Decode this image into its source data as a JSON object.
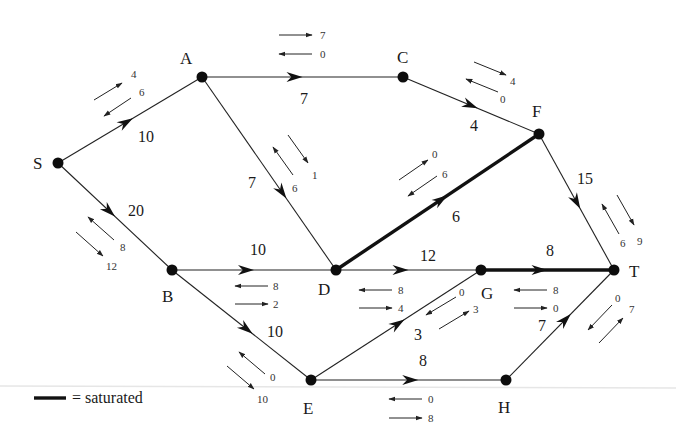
{
  "nodes": [
    {
      "id": "S",
      "x": 58,
      "y": 163,
      "lx": 33,
      "ly": 169
    },
    {
      "id": "A",
      "x": 202,
      "y": 77,
      "lx": 180,
      "ly": 64
    },
    {
      "id": "C",
      "x": 403,
      "y": 77,
      "lx": 397,
      "ly": 63
    },
    {
      "id": "F",
      "x": 539,
      "y": 134,
      "lx": 532,
      "ly": 117
    },
    {
      "id": "B",
      "x": 172,
      "y": 270,
      "lx": 162,
      "ly": 302
    },
    {
      "id": "D",
      "x": 336,
      "y": 270,
      "lx": 318,
      "ly": 295
    },
    {
      "id": "G",
      "x": 481,
      "y": 270,
      "lx": 481,
      "ly": 299
    },
    {
      "id": "T",
      "x": 614,
      "y": 270,
      "lx": 629,
      "ly": 277
    },
    {
      "id": "E",
      "x": 311,
      "y": 380,
      "lx": 303,
      "ly": 414
    },
    {
      "id": "H",
      "x": 506,
      "y": 380,
      "lx": 498,
      "ly": 413
    }
  ],
  "edges": [
    {
      "from": "S",
      "to": "A",
      "capacity": "10",
      "saturated": false,
      "t": 0.52,
      "cx": 138,
      "cy": 142
    },
    {
      "from": "S",
      "to": "B",
      "capacity": "20",
      "saturated": false,
      "t": 0.5,
      "cx": 128,
      "cy": 216
    },
    {
      "from": "A",
      "to": "C",
      "capacity": "7",
      "saturated": false,
      "t": 0.5,
      "cx": 300,
      "cy": 104
    },
    {
      "from": "A",
      "to": "D",
      "capacity": "7",
      "saturated": false,
      "t": 0.63,
      "cx": 248,
      "cy": 188
    },
    {
      "from": "C",
      "to": "F",
      "capacity": "4",
      "saturated": false,
      "t": 0.55,
      "cx": 470,
      "cy": 131
    },
    {
      "from": "D",
      "to": "F",
      "capacity": "6",
      "saturated": true,
      "t": 0.55,
      "cx": 452,
      "cy": 222
    },
    {
      "from": "F",
      "to": "T",
      "capacity": "15",
      "saturated": false,
      "t": 0.55,
      "cx": 577,
      "cy": 184
    },
    {
      "from": "B",
      "to": "D",
      "capacity": "10",
      "saturated": false,
      "t": 0.5,
      "cx": 250,
      "cy": 255
    },
    {
      "from": "B",
      "to": "E",
      "capacity": "10",
      "saturated": false,
      "t": 0.58,
      "cx": 267,
      "cy": 337
    },
    {
      "from": "D",
      "to": "G",
      "capacity": "12",
      "saturated": false,
      "t": 0.5,
      "cx": 420,
      "cy": 261
    },
    {
      "from": "G",
      "to": "T",
      "capacity": "8",
      "saturated": true,
      "t": 0.5,
      "cx": 546,
      "cy": 256
    },
    {
      "from": "E",
      "to": "G",
      "capacity": "3",
      "saturated": false,
      "t": 0.55,
      "cx": 414,
      "cy": 340
    },
    {
      "from": "E",
      "to": "H",
      "capacity": "8",
      "saturated": false,
      "t": 0.55,
      "cx": 419,
      "cy": 366
    },
    {
      "from": "H",
      "to": "T",
      "capacity": "7",
      "saturated": false,
      "t": 0.6,
      "cx": 538,
      "cy": 331
    }
  ],
  "residuals": [
    {
      "edge": "S-A",
      "forward": {
        "value": "4",
        "x1": 94,
        "y1": 100,
        "x2": 122,
        "y2": 83,
        "tx": 131,
        "ty": 78
      },
      "backward": {
        "value": "6",
        "x1": 131,
        "y1": 98,
        "x2": 104,
        "y2": 116,
        "tx": 139,
        "ty": 96
      }
    },
    {
      "edge": "A-C",
      "forward": {
        "value": "7",
        "x1": 279,
        "y1": 35,
        "x2": 312,
        "y2": 35,
        "tx": 320,
        "ty": 39
      },
      "backward": {
        "value": "0",
        "x1": 312,
        "y1": 54,
        "x2": 279,
        "y2": 54,
        "tx": 320,
        "ty": 58
      }
    },
    {
      "edge": "A-D",
      "forward": {
        "value": "1",
        "x1": 288,
        "y1": 135,
        "x2": 308,
        "y2": 163,
        "tx": 312,
        "ty": 179
      },
      "backward": {
        "value": "6",
        "x1": 293,
        "y1": 175,
        "x2": 273,
        "y2": 147,
        "tx": 292,
        "ty": 192
      }
    },
    {
      "edge": "C-F",
      "forward": {
        "value": "4",
        "x1": 474,
        "y1": 62,
        "x2": 506,
        "y2": 75,
        "tx": 510,
        "ty": 85
      },
      "backward": {
        "value": "0",
        "x1": 498,
        "y1": 92,
        "x2": 466,
        "y2": 79,
        "tx": 500,
        "ty": 103
      }
    },
    {
      "edge": "D-F",
      "forward": {
        "value": "0",
        "x1": 399,
        "y1": 180,
        "x2": 428,
        "y2": 160,
        "tx": 432,
        "ty": 158
      },
      "backward": {
        "value": "6",
        "x1": 437,
        "y1": 176,
        "x2": 408,
        "y2": 196,
        "tx": 442,
        "ty": 178
      }
    },
    {
      "edge": "F-T",
      "forward": {
        "value": "9",
        "x1": 617,
        "y1": 195,
        "x2": 634,
        "y2": 225,
        "tx": 637,
        "ty": 245
      },
      "backward": {
        "value": "6",
        "x1": 619,
        "y1": 234,
        "x2": 602,
        "y2": 204,
        "tx": 620,
        "ty": 247
      }
    },
    {
      "edge": "S-B",
      "forward": {
        "value": "12",
        "x1": 76,
        "y1": 232,
        "x2": 103,
        "y2": 256,
        "tx": 106,
        "ty": 270
      },
      "backward": {
        "value": "8",
        "x1": 114,
        "y1": 240,
        "x2": 88,
        "y2": 217,
        "tx": 120,
        "ty": 251
      }
    },
    {
      "edge": "B-D",
      "forward": {
        "value": "2",
        "x1": 235,
        "y1": 304,
        "x2": 268,
        "y2": 304,
        "tx": 273,
        "ty": 308
      },
      "backward": {
        "value": "8",
        "x1": 268,
        "y1": 286,
        "x2": 235,
        "y2": 286,
        "tx": 273,
        "ty": 290
      }
    },
    {
      "edge": "D-G",
      "forward": {
        "value": "4",
        "x1": 359,
        "y1": 308,
        "x2": 392,
        "y2": 308,
        "tx": 398,
        "ty": 312
      },
      "backward": {
        "value": "8",
        "x1": 392,
        "y1": 290,
        "x2": 359,
        "y2": 290,
        "tx": 398,
        "ty": 294
      }
    },
    {
      "edge": "B-E",
      "forward": {
        "value": "10",
        "x1": 227,
        "y1": 366,
        "x2": 254,
        "y2": 389,
        "tx": 257,
        "ty": 403
      },
      "backward": {
        "value": "0",
        "x1": 265,
        "y1": 374,
        "x2": 239,
        "y2": 352,
        "tx": 270,
        "ty": 381
      }
    },
    {
      "edge": "E-G",
      "forward": {
        "value": "3",
        "x1": 439,
        "y1": 329,
        "x2": 469,
        "y2": 311,
        "tx": 473,
        "ty": 313
      },
      "backward": {
        "value": "0",
        "x1": 456,
        "y1": 297,
        "x2": 426,
        "y2": 315,
        "tx": 459,
        "ty": 296
      }
    },
    {
      "edge": "G-T",
      "forward": {
        "value": "0",
        "x1": 514,
        "y1": 308,
        "x2": 547,
        "y2": 308,
        "tx": 553,
        "ty": 312
      },
      "backward": {
        "value": "8",
        "x1": 547,
        "y1": 290,
        "x2": 514,
        "y2": 290,
        "tx": 553,
        "ty": 294
      }
    },
    {
      "edge": "E-H",
      "forward": {
        "value": "8",
        "x1": 389,
        "y1": 418,
        "x2": 422,
        "y2": 418,
        "tx": 428,
        "ty": 422
      },
      "backward": {
        "value": "0",
        "x1": 422,
        "y1": 399,
        "x2": 389,
        "y2": 399,
        "tx": 428,
        "ty": 403
      }
    },
    {
      "edge": "H-T",
      "forward": {
        "value": "7",
        "x1": 599,
        "y1": 343,
        "x2": 623,
        "y2": 318,
        "tx": 629,
        "ty": 313
      },
      "backward": {
        "value": "0",
        "x1": 612,
        "y1": 305,
        "x2": 588,
        "y2": 330,
        "tx": 615,
        "ty": 302
      }
    }
  ],
  "legend": {
    "text": "= saturated"
  }
}
